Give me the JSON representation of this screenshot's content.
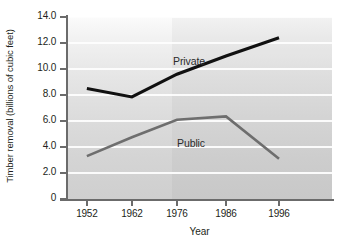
{
  "chart_data": {
    "type": "line",
    "title": "",
    "xlabel": "Year",
    "ylabel": "Timber removal (billions of cubic feet)",
    "categories": [
      "1952",
      "1962",
      "1976",
      "1986",
      "1996"
    ],
    "x": [
      1952,
      1962,
      1976,
      1986,
      1996
    ],
    "ylim": [
      0,
      14
    ],
    "ytick_labels": [
      "14.0",
      "12.0",
      "10.0",
      "8.0",
      "6.0",
      "4.0",
      "2.0",
      "0"
    ],
    "ytick_values": [
      14,
      12,
      10,
      8,
      6,
      4,
      2,
      0
    ],
    "grid": "horizontal",
    "legend": "inline-labels",
    "series": [
      {
        "name": "Private",
        "color": "#111111",
        "values": [
          8.5,
          7.85,
          9.6,
          11.0,
          12.4
        ],
        "label_text": "Private"
      },
      {
        "name": "Public",
        "color": "#6e6e6e",
        "values": [
          3.3,
          4.75,
          6.1,
          6.35,
          3.1
        ],
        "label_text": "Public"
      }
    ],
    "annotations": [
      {
        "text": "Private",
        "series": "Private"
      },
      {
        "text": "Public",
        "series": "Public"
      }
    ]
  },
  "axes": {
    "y_title": "Timber removal (billions of cubic feet)",
    "x_title": "Year",
    "y_ticks": [
      {
        "label": "14.0",
        "value": 14
      },
      {
        "label": "12.0",
        "value": 12
      },
      {
        "label": "10.0",
        "value": 10
      },
      {
        "label": "8.0",
        "value": 8
      },
      {
        "label": "6.0",
        "value": 6
      },
      {
        "label": "4.0",
        "value": 4
      },
      {
        "label": "2.0",
        "value": 2
      },
      {
        "label": "0",
        "value": 0
      }
    ],
    "x_ticks": [
      {
        "label": "1952"
      },
      {
        "label": "1962"
      },
      {
        "label": "1976"
      },
      {
        "label": "1986"
      },
      {
        "label": "1996"
      }
    ]
  },
  "colors": {
    "private_line": "#111111",
    "public_line": "#6e6e6e",
    "axis": "#6b6b6b",
    "gridline": "#fdfdfd",
    "text": "#231f20",
    "plot_bg_top": "#fbfbfb",
    "plot_bg_bottom": "#cfcfcf"
  }
}
